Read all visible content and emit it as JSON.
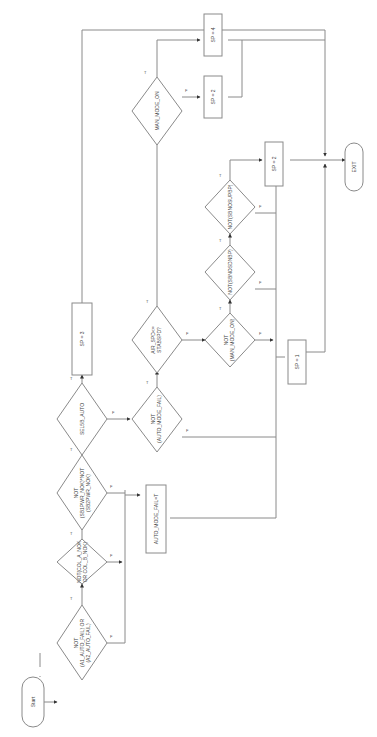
{
  "flowchart": {
    "orientation": "rotated-90-ccw",
    "nodes": {
      "start": "Start",
      "d1": [
        "NOT",
        "(A1_AUTO_FAIL) OR",
        "(A2_AUTO_FAIL)"
      ],
      "d2": [
        "NOT(COL_A_NOK",
        "OR COL_B_NOK)"
      ],
      "d3": [
        "NOT",
        "(SB1PWR_NOK)*NOT",
        "(SB2PWR_NOK)"
      ],
      "d4": [
        "SEL5B_AUTO"
      ],
      "p_sp3": "SP = 3",
      "d5": [
        "NOT",
        "(AUTO_MODE_FAIL)"
      ],
      "p_fail": "AUTO_MODE_FAIL=T",
      "d6": [
        "AIR_SPD<=",
        "STABSPD?"
      ],
      "d7": [
        "MAN_MODE_ON"
      ],
      "p_sp2a": "SP = 2",
      "p_sp4": "SP = 4",
      "d8": [
        "NOT",
        "(MAN_MODE_ON)"
      ],
      "d9": [
        "NOT(SBNOSDNBP)"
      ],
      "d10": [
        "NOT(SBNOSUPBP)"
      ],
      "p_sp2b": "SP = 2",
      "p_sp1": "SP = 1",
      "exit": "EXIT"
    },
    "edge_labels": {
      "true": "T",
      "false": "F"
    }
  }
}
